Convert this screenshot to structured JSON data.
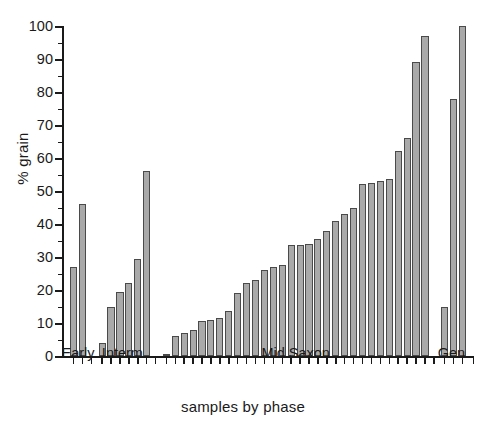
{
  "chart_data": {
    "type": "bar",
    "title": "",
    "xlabel": "samples by phase",
    "ylabel": "% grain",
    "ylim": [
      0,
      100
    ],
    "ytick_step": 10,
    "yminor_step": 5,
    "grid": false,
    "legend": false,
    "ytick_labels": [
      "0",
      "10",
      "20",
      "30",
      "40",
      "50",
      "60",
      "70",
      "80",
      "90",
      "100"
    ],
    "ytick_values": [
      0,
      10,
      20,
      30,
      40,
      50,
      60,
      70,
      80,
      90,
      100
    ],
    "group_labels": [
      "Early",
      "Interm.",
      "Mid Saxon",
      "Gen."
    ],
    "groups": [
      {
        "name": "Early",
        "values": [
          27,
          46
        ]
      },
      {
        "name": "Interm.",
        "values": [
          4,
          15,
          19.5,
          22,
          29.5,
          56
        ]
      },
      {
        "name": "Mid Saxon",
        "values": [
          0.5,
          6,
          7,
          8,
          10.5,
          11,
          11.5,
          13.5,
          19,
          22,
          23,
          26,
          27,
          27.5,
          33.5,
          33.5,
          34,
          35.5,
          38,
          41,
          43,
          45,
          52,
          52.5,
          53,
          53.5,
          62,
          66,
          89,
          97
        ]
      },
      {
        "name": "Gen.",
        "values": [
          15,
          78,
          100
        ]
      }
    ],
    "values_flat": [
      27,
      46,
      4,
      15,
      19.5,
      22,
      29.5,
      56,
      0.5,
      6,
      7,
      8,
      10.5,
      11,
      11.5,
      13.5,
      19,
      22,
      23,
      26,
      27,
      27.5,
      33.5,
      33.5,
      34,
      35.5,
      38,
      41,
      43,
      45,
      52,
      52.5,
      53,
      53.5,
      62,
      66,
      89,
      97,
      15,
      78,
      100
    ],
    "bar_color": "#a9a9a9",
    "bar_edge_color": "#4a4a4a",
    "axis_color": "#1a1a1a"
  }
}
